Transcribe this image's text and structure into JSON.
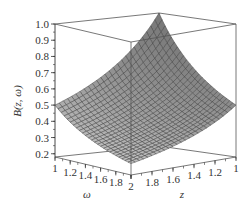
{
  "chart_data": {
    "type": "surface3d",
    "title": "",
    "function_label": "B(z, ω)",
    "xlabel": "ω",
    "ylabel": "z",
    "zlabel": "B(z, ω)",
    "x_range": [
      1,
      2
    ],
    "y_range": [
      1,
      2
    ],
    "z_range": [
      0.18,
      1.0
    ],
    "x_ticks": [
      "1",
      "1.2",
      "1.4",
      "1.6",
      "1.8",
      "2"
    ],
    "y_ticks": [
      "2",
      "1.8",
      "1.6",
      "1.4",
      "1.2",
      "1"
    ],
    "z_ticks": [
      "0.2",
      "0.3",
      "0.4",
      "0.5",
      "0.6",
      "0.7",
      "0.8",
      "0.9",
      "1.0"
    ],
    "corner_values": [
      {
        "z": 1,
        "omega": 1,
        "B": 1.0
      },
      {
        "z": 2,
        "omega": 1,
        "B": 0.5
      },
      {
        "z": 1,
        "omega": 2,
        "B": 0.5
      },
      {
        "z": 2,
        "omega": 2,
        "B": 0.25
      }
    ],
    "surface_color": "#a8a8a8",
    "grid_color": "#3a3a3a",
    "box": true,
    "grid_resolution": 25
  }
}
